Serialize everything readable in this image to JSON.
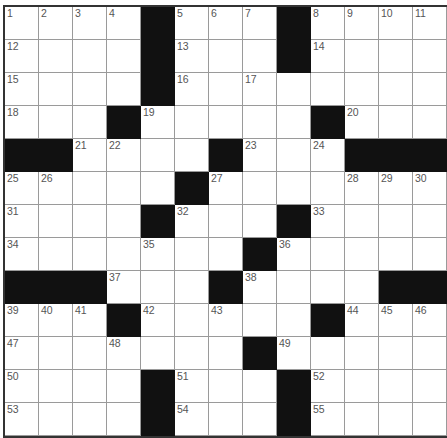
{
  "puzzle": {
    "rows": 13,
    "cols": 13,
    "layout": [
      ".....#...#....",
      "....#...#....",
      "....#........",
      "...#.....#...",
      "##....#...###",
      ".....#.......",
      "....#...#....",
      ".......#.....",
      "###...#....##",
      "...#.....#...",
      ".......#.....",
      "....#...#....",
      "....#...#...."
    ],
    "grid": [
      [
        "1",
        "2",
        "3",
        "4",
        "#",
        "5",
        "6",
        "7",
        "#",
        "8",
        "9",
        "10",
        "11"
      ],
      [
        "12",
        "",
        "",
        "",
        "#",
        "13",
        "",
        "",
        "#",
        "14",
        "",
        "",
        ""
      ],
      [
        "15",
        "",
        "",
        "",
        "#",
        "16",
        "",
        "17",
        "",
        "",
        "",
        "",
        ""
      ],
      [
        "18",
        "",
        "",
        "#",
        "19",
        "",
        "",
        "",
        "",
        "#",
        "20",
        "",
        ""
      ],
      [
        "#",
        "#",
        "21",
        "22",
        "",
        "",
        "#",
        "23",
        "",
        "24",
        "#",
        "#",
        "#"
      ],
      [
        "25",
        "26",
        "",
        "",
        "",
        "#",
        "27",
        "",
        "",
        "",
        "28",
        "29",
        "30"
      ],
      [
        "31",
        "",
        "",
        "",
        "#",
        "32",
        "",
        "",
        "#",
        "33",
        "",
        "",
        ""
      ],
      [
        "34",
        "",
        "",
        "",
        "35",
        "",
        "",
        "#",
        "36",
        "",
        "",
        "",
        ""
      ],
      [
        "#",
        "#",
        "#",
        "37",
        "",
        "",
        "#",
        "38",
        "",
        "",
        "",
        "#",
        "#"
      ],
      [
        "39",
        "40",
        "41",
        "#",
        "42",
        "",
        "43",
        "",
        "",
        "#",
        "44",
        "45",
        "46"
      ],
      [
        "47",
        "",
        "",
        "48",
        "",
        "",
        "",
        "#",
        "49",
        "",
        "",
        "",
        ""
      ],
      [
        "50",
        "",
        "",
        "",
        "#",
        "51",
        "",
        "",
        "#",
        "52",
        "",
        "",
        ""
      ],
      [
        "53",
        "",
        "",
        "",
        "#",
        "54",
        "",
        "",
        "#",
        "55",
        "",
        "",
        ""
      ]
    ],
    "entries": []
  }
}
